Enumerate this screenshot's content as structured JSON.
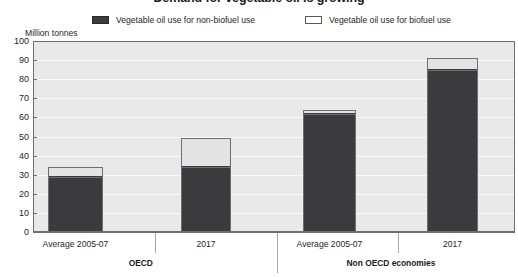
{
  "chart_data": {
    "type": "bar",
    "stacked": true,
    "title": "Demand for vegetable oil is growing",
    "ylabel": "Million tonnes",
    "xlabel": "",
    "ylim": [
      0,
      100
    ],
    "yticks": [
      0,
      10,
      20,
      30,
      40,
      50,
      60,
      70,
      80,
      90,
      100
    ],
    "grid": true,
    "legend_position": "top",
    "categories": [
      "Average 2005-07",
      "2017",
      "Average 2005-07",
      "2017"
    ],
    "groups": [
      {
        "name": "OECD",
        "categories": [
          "Average 2005-07",
          "2017"
        ]
      },
      {
        "name": "Non OECD economies",
        "categories": [
          "Average 2005-07",
          "2017"
        ]
      }
    ],
    "series": [
      {
        "name": "Vegetable oil use for non-biofuel use",
        "color": "#3b3b3d",
        "values": [
          29,
          34,
          62,
          85
        ]
      },
      {
        "name": "Vegetable oil use for biofuel use",
        "color": "#e3e3e3",
        "values": [
          5,
          15,
          2,
          6
        ]
      }
    ],
    "totals": [
      34,
      49,
      64,
      91
    ]
  },
  "chart": {
    "title": "Demand for vegetable oil is growing",
    "yaxis_unit": "Million tonnes",
    "ytick_labels": [
      "100",
      "90",
      "80",
      "70",
      "60",
      "50",
      "40",
      "30",
      "20",
      "10",
      "0"
    ],
    "legend": [
      {
        "label": "Vegetable oil use for non-biofuel use",
        "swatch": "dark"
      },
      {
        "label": "Vegetable oil use for biofuel use",
        "swatch": "light"
      }
    ],
    "category_labels": [
      "Average 2005-07",
      "2017",
      "Average 2005-07",
      "2017"
    ],
    "group_labels": [
      "OECD",
      "Non OECD economies"
    ]
  }
}
